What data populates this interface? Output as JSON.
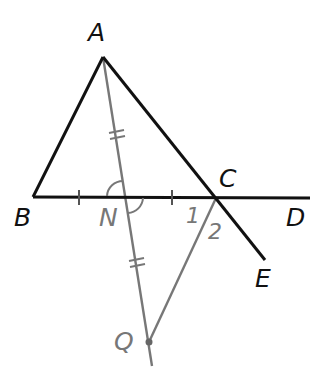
{
  "diagram": {
    "type": "geometry",
    "colors": {
      "primary": "#111111",
      "secondary": "#777777"
    },
    "points": {
      "A": {
        "label": "A",
        "x": 103,
        "y": 57
      },
      "B": {
        "label": "B",
        "x": 33,
        "y": 197
      },
      "C": {
        "label": "C",
        "x": 216,
        "y": 198
      },
      "D": {
        "label": "D",
        "x": 310,
        "y": 198
      },
      "E": {
        "label": "E",
        "x": 265,
        "y": 260
      },
      "N": {
        "label": "N",
        "x": 125,
        "y": 197
      },
      "Q": {
        "label": "Q",
        "x": 149,
        "y": 342
      }
    },
    "angle_labels": {
      "one": "1",
      "two": "2"
    },
    "segments": [
      {
        "from": "B",
        "to": "A",
        "color": "primary"
      },
      {
        "from": "A",
        "to": "E",
        "color": "primary"
      },
      {
        "from": "B",
        "to": "D",
        "color": "primary"
      },
      {
        "from": "A",
        "to": "Q",
        "color": "secondary",
        "note": "extends past Q"
      },
      {
        "from": "C",
        "to": "Q",
        "color": "secondary"
      }
    ],
    "marks": {
      "single_ticks": [
        "BN",
        "NC"
      ],
      "double_ticks": [
        "AN",
        "NQ"
      ],
      "vertical_angle_arcs": [
        "ANB",
        "CNQ"
      ]
    }
  }
}
